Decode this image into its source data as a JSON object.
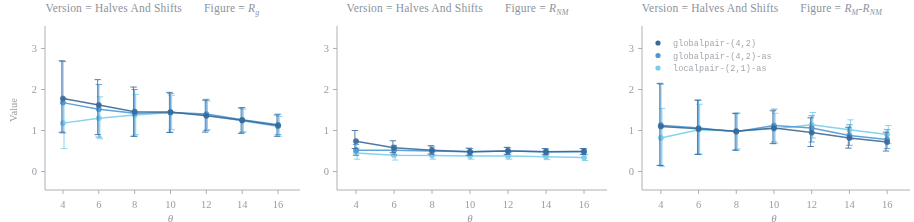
{
  "figure": {
    "background_color": "#ffffff",
    "text_color": "#8c939c"
  },
  "legend": {
    "position": "top-left of third panel",
    "entries": [
      {
        "label": "globalpair-(4,2)",
        "color": "#2a5d8f"
      },
      {
        "label": "globalpair-(4,2)-as",
        "color": "#3f8fd0"
      },
      {
        "label": "localpair-(2,1)-as",
        "color": "#6fc9e8"
      }
    ]
  },
  "panels": [
    {
      "title_prefix": "Version = Halves And Shifts",
      "title_suffix_label": "Figure = ",
      "title_figure": "R",
      "title_figure_sub": "g",
      "ylabel": "Value",
      "xlabel": "θ"
    },
    {
      "title_prefix": "Version = Halves And Shifts",
      "title_suffix_label": "Figure = ",
      "title_figure": "R",
      "title_figure_sub": "NM",
      "ylabel": "",
      "xlabel": "θ"
    },
    {
      "title_prefix": "Version = Halves And Shifts",
      "title_suffix_label": "Figure = ",
      "title_figure": "R",
      "title_figure_sub": "M",
      "title_figure2": "-R",
      "title_figure2_sub": "NM",
      "ylabel": "",
      "xlabel": "θ"
    }
  ],
  "chart_data": [
    {
      "type": "line",
      "title": "Version = Halves And Shifts | Figure = R_g",
      "xlabel": "θ",
      "ylabel": "Value",
      "x": [
        4,
        6,
        8,
        10,
        12,
        14,
        16
      ],
      "xticks": [
        4,
        6,
        8,
        10,
        12,
        14,
        16
      ],
      "yticks": [
        0,
        1,
        2,
        3
      ],
      "xlim": [
        3.0,
        17.0
      ],
      "ylim": [
        -0.45,
        3.45
      ],
      "grid": false,
      "errorbars": true,
      "series": [
        {
          "name": "globalpair-(4,2)",
          "color": "#2a5d8f",
          "values": [
            1.78,
            1.62,
            1.46,
            1.45,
            1.36,
            1.25,
            1.12
          ],
          "err_low": [
            0.82,
            0.72,
            0.6,
            0.5,
            0.4,
            0.32,
            0.26
          ],
          "err_high": [
            0.92,
            0.62,
            0.6,
            0.48,
            0.38,
            0.3,
            0.26
          ]
        },
        {
          "name": "globalpair-(4,2)-as",
          "color": "#3f8fd0",
          "values": [
            1.68,
            1.52,
            1.42,
            1.44,
            1.4,
            1.26,
            1.14
          ],
          "err_low": [
            0.74,
            0.68,
            0.56,
            0.48,
            0.4,
            0.3,
            0.24
          ],
          "err_high": [
            1.0,
            0.6,
            0.58,
            0.46,
            0.36,
            0.3,
            0.26
          ]
        },
        {
          "name": "localpair-(2,1)-as",
          "color": "#6fc9e8",
          "values": [
            1.18,
            1.3,
            1.38,
            1.44,
            1.38,
            1.24,
            1.1
          ],
          "err_low": [
            0.62,
            0.5,
            0.48,
            0.42,
            0.36,
            0.28,
            0.24
          ],
          "err_high": [
            0.6,
            0.52,
            0.5,
            0.42,
            0.34,
            0.28,
            0.24
          ]
        }
      ]
    },
    {
      "type": "line",
      "title": "Version = Halves And Shifts | Figure = R_NM",
      "xlabel": "θ",
      "ylabel": "",
      "x": [
        4,
        6,
        8,
        10,
        12,
        14,
        16
      ],
      "xticks": [
        4,
        6,
        8,
        10,
        12,
        14,
        16
      ],
      "yticks": [
        0,
        1,
        2,
        3
      ],
      "xlim": [
        3.0,
        17.0
      ],
      "ylim": [
        -0.45,
        3.45
      ],
      "grid": false,
      "errorbars": true,
      "series": [
        {
          "name": "globalpair-(4,2)",
          "color": "#2a5d8f",
          "values": [
            0.74,
            0.58,
            0.52,
            0.48,
            0.5,
            0.48,
            0.49
          ],
          "err_low": [
            0.18,
            0.12,
            0.09,
            0.08,
            0.08,
            0.07,
            0.07
          ],
          "err_high": [
            0.26,
            0.17,
            0.11,
            0.09,
            0.09,
            0.08,
            0.07
          ]
        },
        {
          "name": "globalpair-(4,2)-as",
          "color": "#3f8fd0",
          "values": [
            0.52,
            0.52,
            0.5,
            0.48,
            0.5,
            0.48,
            0.49
          ],
          "err_low": [
            0.13,
            0.11,
            0.09,
            0.08,
            0.08,
            0.07,
            0.07
          ],
          "err_high": [
            0.14,
            0.12,
            0.1,
            0.08,
            0.08,
            0.07,
            0.07
          ]
        },
        {
          "name": "localpair-(2,1)-as",
          "color": "#6fc9e8",
          "values": [
            0.45,
            0.4,
            0.39,
            0.38,
            0.38,
            0.36,
            0.34
          ],
          "err_low": [
            0.15,
            0.12,
            0.09,
            0.08,
            0.08,
            0.07,
            0.07
          ],
          "err_high": [
            0.12,
            0.12,
            0.09,
            0.08,
            0.08,
            0.07,
            0.07
          ]
        }
      ]
    },
    {
      "type": "line",
      "title": "Version = Halves And Shifts | Figure = R_M-R_NM",
      "xlabel": "θ",
      "ylabel": "",
      "x": [
        4,
        6,
        8,
        10,
        12,
        14,
        16
      ],
      "xticks": [
        4,
        6,
        8,
        10,
        12,
        14,
        16
      ],
      "yticks": [
        0,
        1,
        2,
        3
      ],
      "xlim": [
        3.0,
        17.0
      ],
      "ylim": [
        -0.45,
        3.45
      ],
      "grid": false,
      "errorbars": true,
      "series": [
        {
          "name": "globalpair-(4,2)",
          "color": "#2a5d8f",
          "values": [
            1.1,
            1.04,
            0.98,
            1.06,
            0.95,
            0.82,
            0.72
          ],
          "err_low": [
            0.95,
            0.62,
            0.46,
            0.38,
            0.34,
            0.25,
            0.22
          ],
          "err_high": [
            1.05,
            0.7,
            0.44,
            0.42,
            0.36,
            0.26,
            0.24
          ]
        },
        {
          "name": "globalpair-(4,2)-as",
          "color": "#3f8fd0",
          "values": [
            1.13,
            1.06,
            0.97,
            1.12,
            1.06,
            0.88,
            0.78
          ],
          "err_low": [
            0.98,
            0.64,
            0.45,
            0.4,
            0.34,
            0.24,
            0.22
          ],
          "err_high": [
            1.0,
            0.68,
            0.44,
            0.4,
            0.3,
            0.26,
            0.24
          ]
        },
        {
          "name": "localpair-(2,1)-as",
          "color": "#6fc9e8",
          "values": [
            0.82,
            1.02,
            0.99,
            1.04,
            1.14,
            1.02,
            0.9
          ],
          "err_low": [
            0.7,
            0.6,
            0.44,
            0.36,
            0.32,
            0.24,
            0.22
          ],
          "err_high": [
            0.72,
            0.62,
            0.44,
            0.38,
            0.3,
            0.24,
            0.22
          ]
        }
      ]
    }
  ]
}
